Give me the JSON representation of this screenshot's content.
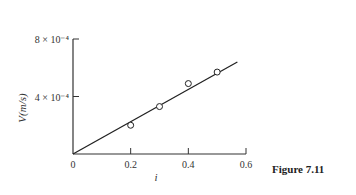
{
  "chart_data": {
    "type": "scatter",
    "title": "",
    "xlabel": "i",
    "ylabel": "V(m/s)",
    "xlim": [
      0,
      0.6
    ],
    "ylim": [
      0,
      0.0008
    ],
    "x_ticks": [
      0,
      0.2,
      0.4,
      0.6
    ],
    "x_tick_labels": [
      "0",
      "0.2",
      "0.4",
      "0.6"
    ],
    "y_ticks": [
      0.0004,
      0.0008
    ],
    "y_tick_labels": [
      "4 × 10⁻⁴",
      "8 × 10⁻⁴"
    ],
    "grid": false,
    "series": [
      {
        "name": "measured",
        "marker": "open-circle",
        "x": [
          0.2,
          0.3,
          0.4,
          0.5
        ],
        "y": [
          0.0002,
          0.00033,
          0.00049,
          0.00057
        ]
      },
      {
        "name": "linear fit",
        "style": "line",
        "x": [
          0,
          0.57
        ],
        "y": [
          0,
          0.00064
        ]
      }
    ]
  },
  "caption": "Figure 7.11"
}
